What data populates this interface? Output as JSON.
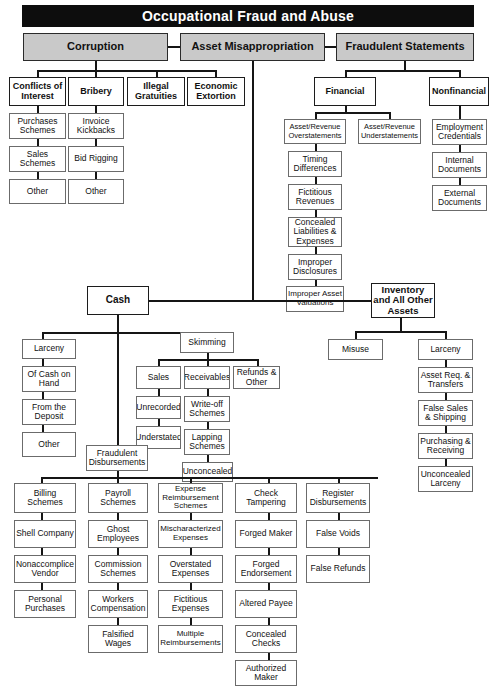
{
  "title": "Occupational Fraud and Abuse",
  "diagram": {
    "kind": "tree-taxonomy",
    "root": "Occupational Fraud and Abuse"
  },
  "branches": {
    "corruption": "Corruption",
    "asset_misappropriation": "Asset Misappropriation",
    "fraudulent_statements": "Fraudulent Statements"
  },
  "corruption_children": [
    "Conflicts of Interest",
    "Bribery",
    "Illegal Gratuities",
    "Economic Extortion"
  ],
  "conflicts_of_interest": [
    "Purchases Schemes",
    "Sales Schemes",
    "Other"
  ],
  "bribery": [
    "Invoice Kickbacks",
    "Bid Rigging",
    "Other"
  ],
  "fraudulent_statements_children": [
    "Financial",
    "Nonfinancial"
  ],
  "financial_children": [
    "Asset/Revenue Overstatements",
    "Asset/Revenue Understatements"
  ],
  "overstatements_children": [
    "Timing Differences",
    "Fictitious Revenues",
    "Concealed Liabilities & Expenses",
    "Improper Disclosures",
    "Improper Asset Valuations"
  ],
  "nonfinancial_children": [
    "Employment Credentials",
    "Internal Documents",
    "External Documents"
  ],
  "asset_misappropriation_children": [
    "Cash",
    "Inventory and All Other Assets"
  ],
  "cash_children": [
    "Larceny",
    "Skimming",
    "Fraudulent Disbursements"
  ],
  "cash_larceny": [
    "Of Cash on Hand",
    "From the Deposit",
    "Other"
  ],
  "skimming_children": [
    "Sales",
    "Receivables",
    "Refunds & Other"
  ],
  "skimming_sales": [
    "Unrecorded",
    "Understated"
  ],
  "skimming_receivables": [
    "Write-off Schemes",
    "Lapping Schemes",
    "Unconcealed"
  ],
  "fraudulent_disbursements_children": [
    "Billing Schemes",
    "Payroll Schemes",
    "Expense Reimbursement Schemes",
    "Check Tampering",
    "Register Disbursements"
  ],
  "billing_schemes": [
    "Shell Company",
    "Nonaccomplice Vendor",
    "Personal Purchases"
  ],
  "payroll_schemes": [
    "Ghost Employees",
    "Commission Schemes",
    "Workers Compensation",
    "Falsified Wages"
  ],
  "expense_reimbursement_schemes": [
    "Mischaracterized Expenses",
    "Overstated Expenses",
    "Fictitious Expenses",
    "Multiple Reimbursements"
  ],
  "check_tampering": [
    "Forged Maker",
    "Forged Endorsement",
    "Altered Payee",
    "Concealed Checks",
    "Authorized Maker"
  ],
  "register_disbursements": [
    "False Voids",
    "False Refunds"
  ],
  "inventory_children": [
    "Misuse",
    "Larceny"
  ],
  "inventory_larceny": [
    "Asset Req. & Transfers",
    "False Sales & Shipping",
    "Purchasing & Receiving",
    "Unconcealed Larceny"
  ],
  "colors": {
    "banner_bg": "#0d0d0d",
    "banner_text": "#ffffff",
    "tier1_fill": "#c9c9c9",
    "box_fill": "#ffffff",
    "line": "#151515",
    "text": "#111111"
  }
}
